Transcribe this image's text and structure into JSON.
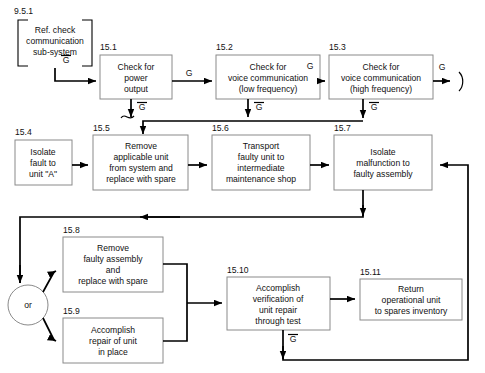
{
  "diagram": {
    "title_block": {
      "number": "9.5.1",
      "lines": [
        "Ref. check",
        "communication",
        "sub-system"
      ]
    },
    "boxes": [
      {
        "id": "15.1",
        "lines": [
          "Check for",
          "power",
          "output"
        ]
      },
      {
        "id": "15.2",
        "lines": [
          "Check for",
          "voice communication",
          "(low frequency)"
        ]
      },
      {
        "id": "15.3",
        "lines": [
          "Check for",
          "voice communication",
          "(high frequency)"
        ]
      },
      {
        "id": "15.4",
        "lines": [
          "Isolate",
          "fault to",
          "unit \"A\""
        ]
      },
      {
        "id": "15.5",
        "lines": [
          "Remove",
          "applicable unit",
          "from system and",
          "replace with spare"
        ]
      },
      {
        "id": "15.6",
        "lines": [
          "Transport",
          "faulty unit to",
          "intermediate",
          "maintenance shop"
        ]
      },
      {
        "id": "15.7",
        "lines": [
          "Isolate",
          "malfunction to",
          "faulty assembly"
        ]
      },
      {
        "id": "15.8",
        "lines": [
          "Remove",
          "faulty assembly",
          "and",
          "replace with spare"
        ]
      },
      {
        "id": "15.9",
        "lines": [
          "Accomplish",
          "repair of unit",
          "in place"
        ]
      },
      {
        "id": "15.10",
        "lines": [
          "Accomplish",
          "verification of",
          "unit repair",
          "through test"
        ]
      },
      {
        "id": "15.11",
        "lines": [
          "Return",
          "operational unit",
          "to spares inventory"
        ]
      }
    ],
    "decision_node": {
      "label": "or"
    },
    "edge_labels": {
      "g": "G",
      "g_not": "G",
      "entry_g": "G",
      "b1_down": "G",
      "b2_right": "G",
      "b2_down": "G",
      "b3_right": "G",
      "b3_down": "G",
      "b10_down": "G"
    },
    "colors": {
      "line": "#000000",
      "box_stroke": "#8a8a8a",
      "background": "#ffffff",
      "text": "#111111"
    }
  }
}
